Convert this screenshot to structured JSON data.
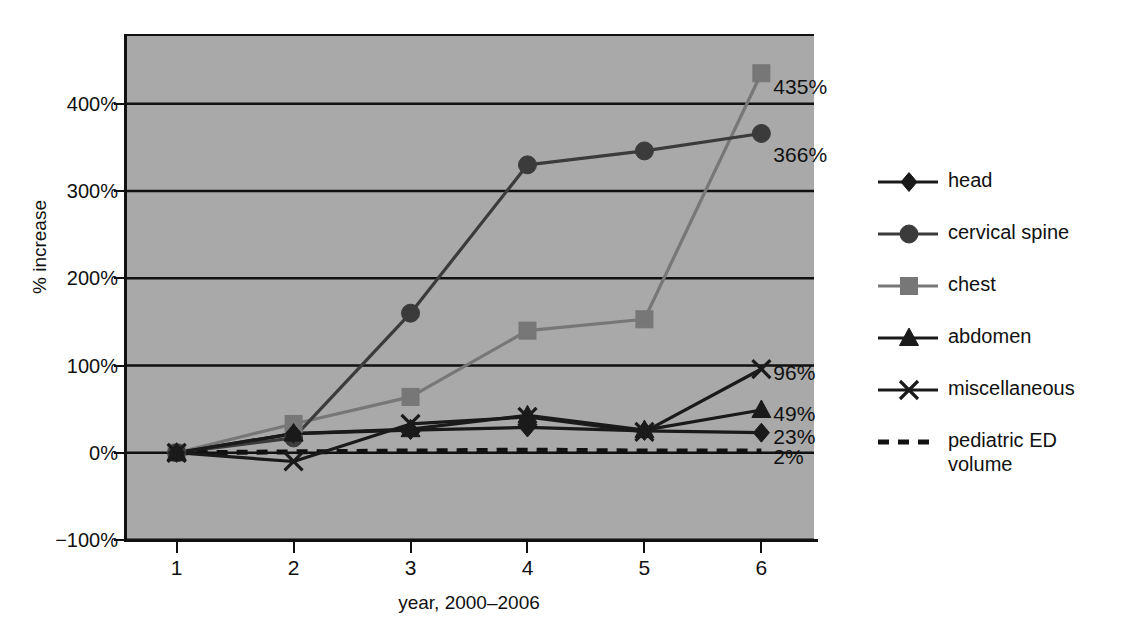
{
  "chart_data": {
    "type": "line",
    "title": "",
    "xlabel": "year, 2000–2006",
    "ylabel": "% increase",
    "x": [
      1,
      2,
      3,
      4,
      5,
      6
    ],
    "xticklabels": [
      "1",
      "2",
      "3",
      "4",
      "5",
      "6"
    ],
    "yticklabels": [
      "400%",
      "300%",
      "200%",
      "100%",
      "0%",
      "−100%"
    ],
    "ytickvalues": [
      400,
      300,
      200,
      100,
      0,
      -100
    ],
    "ylim": [
      -100,
      480
    ],
    "xlim": [
      0.55,
      6.45
    ],
    "grid": true,
    "legend_position": "right",
    "plot_background": "#a9a9a9",
    "series": [
      {
        "name": "head",
        "marker": "diamond",
        "color": "#1a1a1a",
        "linestyle": "solid",
        "values": [
          0,
          22,
          26,
          29,
          25,
          23
        ],
        "end_label": "23%"
      },
      {
        "name": "cervical spine",
        "marker": "circle",
        "color": "#3b3b3b",
        "linestyle": "solid",
        "values": [
          0,
          17,
          160,
          330,
          346,
          366
        ],
        "end_label": "366%"
      },
      {
        "name": "chest",
        "marker": "square",
        "color": "#777777",
        "linestyle": "solid",
        "values": [
          0,
          33,
          64,
          140,
          153,
          435
        ],
        "end_label": "435%"
      },
      {
        "name": "abdomen",
        "marker": "triangle",
        "color": "#1a1a1a",
        "linestyle": "solid",
        "values": [
          0,
          22,
          27,
          43,
          26,
          49
        ],
        "end_label": "49%"
      },
      {
        "name": "miscellaneous",
        "marker": "x",
        "color": "#1a1a1a",
        "linestyle": "solid",
        "values": [
          0,
          -10,
          33,
          41,
          24,
          96
        ],
        "end_label": "96%"
      },
      {
        "name": "pediatric ED volume",
        "marker": "none",
        "color": "#111111",
        "linestyle": "dashed",
        "values": [
          0,
          1,
          2,
          3,
          2,
          2
        ],
        "end_label": "2%"
      }
    ]
  },
  "legend": {
    "items": [
      {
        "label": "head",
        "marker": "diamond-marker-icon"
      },
      {
        "label": "cervical spine",
        "marker": "circle-marker-icon"
      },
      {
        "label": "chest",
        "marker": "square-marker-icon"
      },
      {
        "label": "abdomen",
        "marker": "triangle-marker-icon"
      },
      {
        "label": "miscellaneous",
        "marker": "x-marker-icon"
      },
      {
        "label": "pediatric ED volume",
        "marker": "dashed-line-icon"
      }
    ]
  }
}
